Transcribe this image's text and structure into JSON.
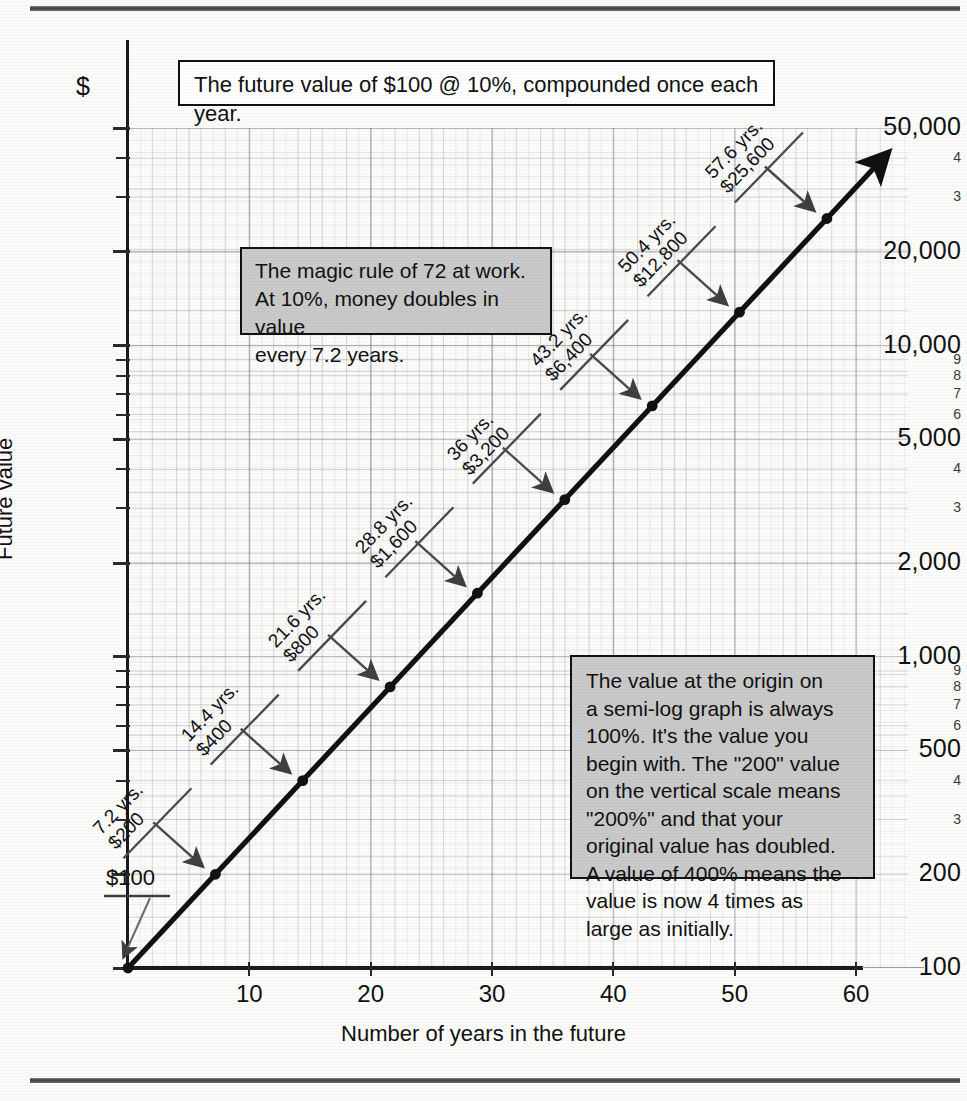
{
  "figure": {
    "title_box": "The future value of $100 @ 10%, compounded once each year.",
    "y_axis_title": "Future value",
    "x_axis_title": "Number of years in the future",
    "y_unit_symbol": "$",
    "notes": [
      {
        "id": "rule-of-72",
        "text": "The magic rule of 72 at work.\nAt 10%, money doubles in value\nevery 7.2 years."
      },
      {
        "id": "origin-value",
        "text": "The value at the origin on\na semi-log graph is always\n100%.  It's the value you\nbegin with.  The \"200\" value\non the vertical scale means\n\"200%\" and that your\noriginal value has doubled.\nA value of 400% means the\nvalue is now 4 times as\nlarge as initially."
      }
    ],
    "colors": {
      "note_background": "#c9c9c9",
      "line": "#111111",
      "grid": "#7d8291",
      "axis": "#1b1b1b"
    }
  },
  "chart_data": {
    "type": "line",
    "title": "The future value of $100 @ 10%, compounded once each year.",
    "xlabel": "Number of years in the future",
    "ylabel": "Future value",
    "xlim": [
      0,
      63
    ],
    "ylim": [
      100,
      50000
    ],
    "yscale": "log",
    "grid": true,
    "legend": "none",
    "x_ticks": [
      "10",
      "20",
      "30",
      "40",
      "50",
      "60"
    ],
    "x_tick_values": [
      10,
      20,
      30,
      40,
      50,
      60
    ],
    "y_ticks": [
      {
        "value": 100,
        "label": "100",
        "major": true
      },
      {
        "value": 200,
        "label": "200",
        "major": true
      },
      {
        "value": 300,
        "label": "3",
        "major": false
      },
      {
        "value": 400,
        "label": "4",
        "major": false
      },
      {
        "value": 500,
        "label": "500",
        "major": true
      },
      {
        "value": 600,
        "label": "6",
        "major": false
      },
      {
        "value": 700,
        "label": "7",
        "major": false
      },
      {
        "value": 800,
        "label": "8",
        "major": false
      },
      {
        "value": 900,
        "label": "9",
        "major": false
      },
      {
        "value": 1000,
        "label": "1,000",
        "major": true
      },
      {
        "value": 2000,
        "label": "2,000",
        "major": true
      },
      {
        "value": 3000,
        "label": "3",
        "major": false
      },
      {
        "value": 4000,
        "label": "4",
        "major": false
      },
      {
        "value": 5000,
        "label": "5,000",
        "major": true
      },
      {
        "value": 6000,
        "label": "6",
        "major": false
      },
      {
        "value": 7000,
        "label": "7",
        "major": false
      },
      {
        "value": 8000,
        "label": "8",
        "major": false
      },
      {
        "value": 9000,
        "label": "9",
        "major": false
      },
      {
        "value": 10000,
        "label": "10,000",
        "major": true
      },
      {
        "value": 20000,
        "label": "20,000",
        "major": true
      },
      {
        "value": 30000,
        "label": "3",
        "major": false
      },
      {
        "value": 40000,
        "label": "4",
        "major": false
      },
      {
        "value": 50000,
        "label": "50,000",
        "major": true
      }
    ],
    "series": [
      {
        "name": "Future value of $100 at 10% compounded annually",
        "x": [
          0,
          7.2,
          14.4,
          21.6,
          28.8,
          36,
          43.2,
          50.4,
          57.6
        ],
        "y": [
          100,
          200,
          400,
          800,
          1600,
          3200,
          6400,
          12800,
          25600
        ]
      }
    ],
    "annotations": [
      {
        "x": 0,
        "y": 100,
        "label": "$100",
        "years": "0",
        "amount": "$100"
      },
      {
        "x": 7.2,
        "y": 200,
        "label": "7.2 yrs.\n$200",
        "years": "7.2 yrs.",
        "amount": "$200"
      },
      {
        "x": 14.4,
        "y": 400,
        "label": "14.4 yrs.\n$400",
        "years": "14.4 yrs.",
        "amount": "$400"
      },
      {
        "x": 21.6,
        "y": 800,
        "label": "21.6 yrs.\n$800",
        "years": "21.6 yrs.",
        "amount": "$800"
      },
      {
        "x": 28.8,
        "y": 1600,
        "label": "28.8 yrs.\n$1,600",
        "years": "28.8 yrs.",
        "amount": "$1,600"
      },
      {
        "x": 36,
        "y": 3200,
        "label": "36 yrs.\n$3,200",
        "years": "36 yrs.",
        "amount": "$3,200"
      },
      {
        "x": 43.2,
        "y": 6400,
        "label": "43.2 yrs.\n$6,400",
        "years": "43.2 yrs.",
        "amount": "$6,400"
      },
      {
        "x": 50.4,
        "y": 12800,
        "label": "50.4 yrs.\n$12,800",
        "years": "50.4 yrs.",
        "amount": "$12,800"
      },
      {
        "x": 57.6,
        "y": 25600,
        "label": "57.6 yrs.\n$25,600",
        "years": "57.6 yrs.",
        "amount": "$25,600"
      }
    ]
  }
}
